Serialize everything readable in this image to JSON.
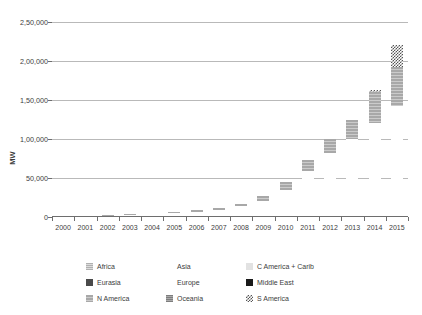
{
  "chart_data": {
    "type": "bar",
    "stacked": true,
    "title": "",
    "xlabel": "",
    "ylabel": "MW",
    "ylim": [
      0,
      250000
    ],
    "ytick_labels": [
      "0",
      "50,000",
      "1,00,000",
      "1,50,000",
      "2,00,000",
      "2,50,000"
    ],
    "ytick_values": [
      0,
      50000,
      100000,
      150000,
      200000,
      250000
    ],
    "grid": true,
    "legend_position": "bottom",
    "categories": [
      "2000",
      "2001",
      "2002",
      "2003",
      "2004",
      "2005",
      "2006",
      "2007",
      "2008",
      "2009",
      "2010",
      "2011",
      "2012",
      "2013",
      "2014",
      "2015"
    ],
    "series": [
      {
        "name": "Africa",
        "pattern": "p-africa",
        "color": "#b0b0b0",
        "values": [
          0,
          0,
          0,
          0,
          0,
          0,
          0,
          0,
          0,
          0,
          0,
          0,
          0,
          0,
          0,
          0
        ]
      },
      {
        "name": "Asia",
        "pattern": "p-asia",
        "color": "#8c8c8c",
        "values": [
          0,
          0,
          0,
          0,
          0,
          0,
          0,
          0,
          1500,
          3000,
          5000,
          8000,
          12000,
          20000,
          32000,
          45000
        ]
      },
      {
        "name": "C America + Carib",
        "pattern": "p-camerica",
        "color": "#e2e2e2",
        "values": [
          0,
          0,
          0,
          0,
          0,
          0,
          0,
          0,
          0,
          0,
          0,
          0,
          0,
          0,
          0,
          0
        ]
      },
      {
        "name": "Eurasia",
        "pattern": "p-eurasia",
        "color": "#4a4a4a",
        "values": [
          0,
          0,
          0,
          0,
          0,
          0,
          0,
          0,
          0,
          0,
          0,
          0,
          0,
          0,
          0,
          0
        ]
      },
      {
        "name": "Europe",
        "pattern": "p-europe",
        "color": "#b5b5b5",
        "values": [
          500,
          900,
          1600,
          2600,
          3500,
          5000,
          7000,
          9000,
          12000,
          18000,
          30000,
          51000,
          70000,
          80000,
          88000,
          97000
        ]
      },
      {
        "name": "Middle East",
        "pattern": "p-middleeast",
        "color": "#1a1a1a",
        "values": [
          0,
          0,
          0,
          0,
          0,
          0,
          0,
          0,
          0,
          0,
          0,
          0,
          0,
          0,
          0,
          0
        ]
      },
      {
        "name": "N America",
        "pattern": "p-namerica",
        "color": "#a8a8a8",
        "values": [
          200,
          300,
          400,
          600,
          800,
          1200,
          1800,
          2500,
          3500,
          6000,
          10000,
          14000,
          18000,
          25000,
          40000,
          50000
        ]
      },
      {
        "name": "Oceania",
        "pattern": "p-oceania",
        "color": "#7d7d7d",
        "values": [
          0,
          0,
          0,
          0,
          0,
          0,
          0,
          0,
          0,
          0,
          0,
          0,
          0,
          0,
          0,
          0
        ]
      },
      {
        "name": "S America",
        "pattern": "p-samerica",
        "color": "#555555",
        "values": [
          0,
          0,
          0,
          0,
          0,
          0,
          0,
          0,
          0,
          0,
          0,
          0,
          0,
          0,
          3000,
          28000
        ]
      }
    ],
    "totals": [
      700,
      1200,
      2000,
      3200,
      4300,
      6200,
      8800,
      11500,
      17000,
      27000,
      45000,
      73000,
      100000,
      125000,
      163000,
      220000
    ]
  },
  "legend": {
    "items": [
      {
        "label": "Africa",
        "pattern": "p-africa"
      },
      {
        "label": "Asia",
        "pattern": "p-asia"
      },
      {
        "label": "C America + Carib",
        "pattern": "p-camerica"
      },
      {
        "label": "Eurasia",
        "pattern": "p-eurasia"
      },
      {
        "label": "Europe",
        "pattern": "p-europe"
      },
      {
        "label": "Middle East",
        "pattern": "p-middleeast"
      },
      {
        "label": "N America",
        "pattern": "p-namerica"
      },
      {
        "label": "Oceania",
        "pattern": "p-oceania"
      },
      {
        "label": "S America",
        "pattern": "p-samerica"
      }
    ]
  }
}
